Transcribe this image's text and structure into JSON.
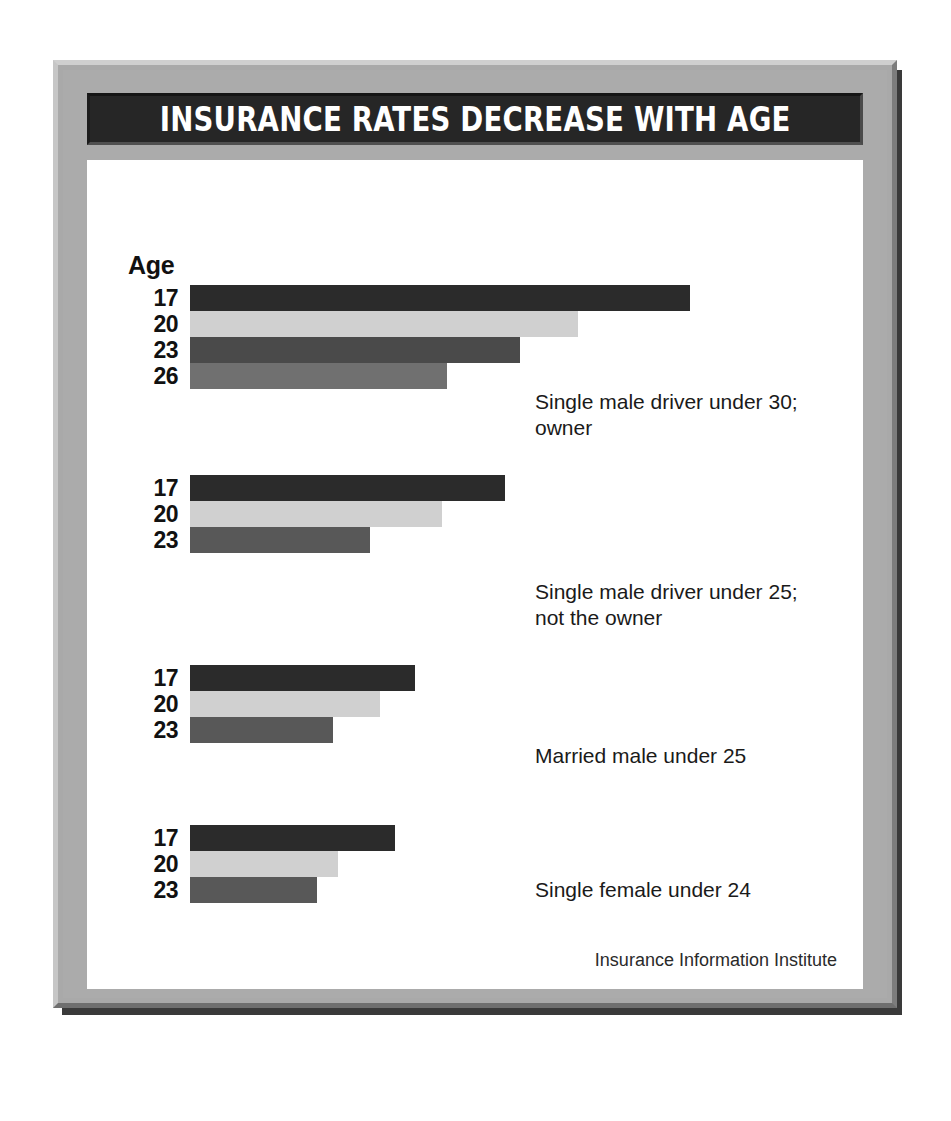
{
  "title": "INSURANCE RATES DECREASE WITH AGE",
  "age_header": "Age",
  "credit": "Insurance Information Institute",
  "colors": {
    "frame": "#a9a9a9",
    "title_bar": "#262626",
    "canvas": "#ffffff",
    "bar_darkest": "#2b2b2b",
    "bar_light": "#d0d0d0",
    "bar_dark_mid": "#4a4a4a",
    "bar_mid": "#707070",
    "bar_mid_dark": "#585858"
  },
  "chart_data": {
    "type": "bar",
    "orientation": "horizontal",
    "title": "INSURANCE RATES DECREASE WITH AGE",
    "xlabel": "",
    "ylabel": "Age",
    "grid": false,
    "legend": false,
    "source": "Insurance Information Institute",
    "note": "Bar lengths represent relative insurance premium; no numeric axis is shown.",
    "groups": [
      {
        "caption": "Single male driver under 30;\nowner",
        "categories": [
          "17",
          "20",
          "23",
          "26"
        ],
        "values": [
          100,
          77.6,
          66.0,
          51.4
        ],
        "colors": [
          "#2b2b2b",
          "#d0d0d0",
          "#4a4a4a",
          "#707070"
        ]
      },
      {
        "caption": "Single male driver under 25;\nnot the owner",
        "categories": [
          "17",
          "20",
          "23"
        ],
        "values": [
          63.0,
          50.4,
          36.0
        ],
        "colors": [
          "#2b2b2b",
          "#d0d0d0",
          "#585858"
        ]
      },
      {
        "caption": "Married male under 25",
        "categories": [
          "17",
          "20",
          "23"
        ],
        "values": [
          45.0,
          38.0,
          28.6
        ],
        "colors": [
          "#2b2b2b",
          "#d0d0d0",
          "#585858"
        ]
      },
      {
        "caption": "Single female under 24",
        "categories": [
          "17",
          "20",
          "23"
        ],
        "values": [
          41.0,
          29.6,
          25.4
        ],
        "colors": [
          "#2b2b2b",
          "#d0d0d0",
          "#585858"
        ]
      }
    ]
  }
}
